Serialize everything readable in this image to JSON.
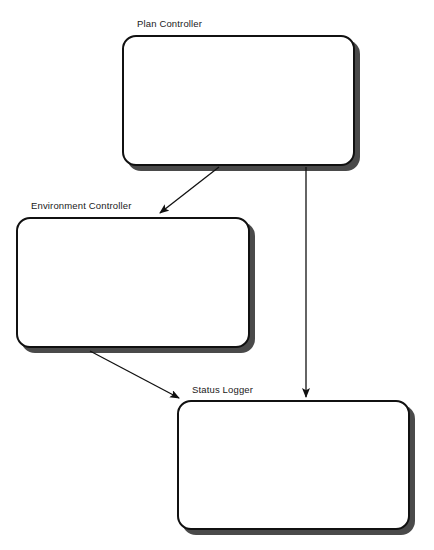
{
  "diagram": {
    "type": "block-diagram",
    "canvas": {
      "width": 434,
      "height": 550,
      "background": "#ffffff"
    },
    "style": {
      "node_fill": "#ffffff",
      "node_border": "#111111",
      "node_shadow": "#4a4a4a",
      "edge_color": "#111111",
      "label_color": "#1a1a1a"
    },
    "nodes": [
      {
        "id": "plan-controller",
        "label": "Plan Controller",
        "x": 122,
        "y": 35,
        "width": 233,
        "height": 131,
        "label_x": 137,
        "label_y": 18
      },
      {
        "id": "environment-controller",
        "label": "Environment Controller",
        "x": 16,
        "y": 217,
        "width": 234,
        "height": 131,
        "label_x": 31,
        "label_y": 200
      },
      {
        "id": "status-logger",
        "label": "Status Logger",
        "x": 177,
        "y": 400,
        "width": 233,
        "height": 130,
        "label_x": 192,
        "label_y": 384
      }
    ],
    "edges": [
      {
        "id": "plan-to-environment",
        "from": "plan-controller",
        "to": "environment-controller",
        "label": "",
        "x1": 219,
        "y1": 167,
        "x2": 160,
        "y2": 213
      },
      {
        "id": "plan-to-status",
        "from": "plan-controller",
        "to": "status-logger",
        "label": "",
        "x1": 306,
        "y1": 167,
        "x2": 306,
        "y2": 397
      },
      {
        "id": "environment-to-status",
        "from": "environment-controller",
        "to": "status-logger",
        "label": "",
        "x1": 90,
        "y1": 351,
        "x2": 179,
        "y2": 398
      }
    ]
  }
}
